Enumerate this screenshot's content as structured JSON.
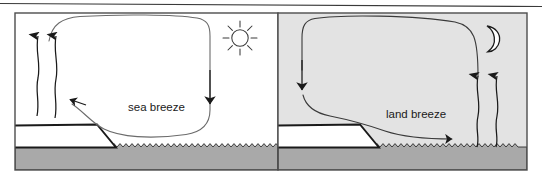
{
  "figure": {
    "title_rule": "",
    "panels": [
      {
        "id": "daytime",
        "name": "sea-breeze-panel",
        "label": "sea breeze",
        "sky_color": "#ffffff",
        "land_color": "#ffffff",
        "water_color": "#a9a9a9",
        "celestial_icon": "sun-icon",
        "circulation_direction": "counterclockwise",
        "surface_wind_direction": "left",
        "rising_air_side": "left",
        "sinking_air_side": "right"
      },
      {
        "id": "nighttime",
        "name": "land-breeze-panel",
        "label": "land breeze",
        "sky_color": "#e3e3e3",
        "land_color": "#ffffff",
        "water_color": "#a9a9a9",
        "celestial_icon": "moon-icon",
        "circulation_direction": "clockwise",
        "surface_wind_direction": "right",
        "rising_air_side": "right",
        "sinking_air_side": "left"
      }
    ],
    "colors": {
      "stroke": "#1a1a1a",
      "thin_stroke": "#555555",
      "water": "#a9a9a9",
      "night_sky": "#e3e3e3",
      "border": "#4d4d4d",
      "rule": "#333333"
    }
  }
}
